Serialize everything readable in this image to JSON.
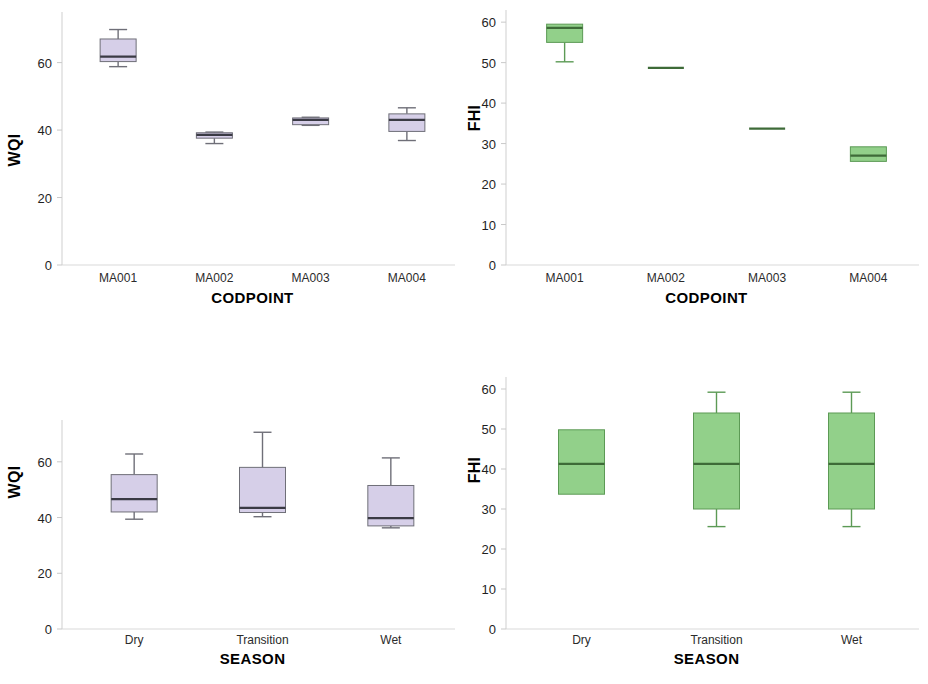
{
  "figure": {
    "width": 928,
    "height": 684,
    "background": "#ffffff",
    "panel_count": 4
  },
  "colors": {
    "wqi_box_fill": "#d6cfe8",
    "wqi_box_stroke": "#6f6f78",
    "fhi_box_fill": "#92d08a",
    "fhi_box_stroke": "#5c9a55",
    "median_wqi": "#3a3a44",
    "median_fhi": "#3e6b38",
    "axis": "#d9d9d9",
    "text": "#1f1f1f"
  },
  "chart_data": [
    {
      "id": "wqi-by-codpoint",
      "type": "box",
      "panel": "top-left",
      "title": "",
      "xlabel": "CODPOINT",
      "ylabel": "WQI",
      "ylim": [
        0,
        75
      ],
      "yticks": [
        0,
        20,
        40,
        60
      ],
      "ytick_labels": [
        "0",
        "20",
        "40",
        "60"
      ],
      "grid": false,
      "categories": [
        "MA001",
        "MA002",
        "MA003",
        "MA004"
      ],
      "box_fill": "#d6cfe8",
      "boxes": [
        {
          "category": "MA001",
          "whisker_low": 58.8,
          "q1": 60.3,
          "median": 61.8,
          "q3": 67.0,
          "whisker_high": 69.8
        },
        {
          "category": "MA002",
          "whisker_low": 36.0,
          "q1": 37.6,
          "median": 38.6,
          "q3": 39.2,
          "whisker_high": 39.4
        },
        {
          "category": "MA003",
          "whisker_low": 41.4,
          "q1": 41.6,
          "median": 43.0,
          "q3": 43.6,
          "whisker_high": 43.8
        },
        {
          "category": "MA004",
          "whisker_low": 36.9,
          "q1": 39.6,
          "median": 43.0,
          "q3": 44.8,
          "whisker_high": 46.6
        }
      ]
    },
    {
      "id": "fhi-by-codpoint",
      "type": "box",
      "panel": "top-right",
      "title": "",
      "xlabel": "CODPOINT",
      "ylabel": "FHI",
      "ylim": [
        0,
        63
      ],
      "yticks": [
        0,
        10,
        20,
        30,
        40,
        50,
        60
      ],
      "ytick_labels": [
        "0",
        "10",
        "20",
        "30",
        "40",
        "50",
        "60"
      ],
      "grid": false,
      "categories": [
        "MA001",
        "MA002",
        "MA003",
        "MA004"
      ],
      "box_fill": "#92d08a",
      "boxes": [
        {
          "category": "MA001",
          "whisker_low": 50.2,
          "q1": 55.0,
          "median": 58.6,
          "q3": 59.5,
          "whisker_high": 59.5
        },
        {
          "category": "MA002",
          "whisker_low": 48.7,
          "q1": 48.7,
          "median": 48.7,
          "q3": 48.7,
          "whisker_high": 48.7
        },
        {
          "category": "MA003",
          "whisker_low": 33.7,
          "q1": 33.7,
          "median": 33.7,
          "q3": 33.7,
          "whisker_high": 33.7
        },
        {
          "category": "MA004",
          "whisker_low": 25.6,
          "q1": 25.6,
          "median": 27.0,
          "q3": 29.2,
          "whisker_high": 29.2
        }
      ]
    },
    {
      "id": "wqi-by-season",
      "type": "box",
      "panel": "bottom-left",
      "title": "",
      "xlabel": "SEASON",
      "ylabel": "WQI",
      "ylim": [
        0,
        75
      ],
      "yticks": [
        0,
        20,
        40,
        60
      ],
      "ytick_labels": [
        "0",
        "20",
        "40",
        "60"
      ],
      "grid": false,
      "categories": [
        "Dry",
        "Transition",
        "Wet"
      ],
      "box_fill": "#d6cfe8",
      "boxes": [
        {
          "category": "Dry",
          "whisker_low": 39.4,
          "q1": 42.0,
          "median": 46.6,
          "q3": 55.4,
          "whisker_high": 62.8
        },
        {
          "category": "Transition",
          "whisker_low": 40.3,
          "q1": 41.8,
          "median": 43.5,
          "q3": 58.0,
          "whisker_high": 70.6
        },
        {
          "category": "Wet",
          "whisker_low": 36.3,
          "q1": 37.0,
          "median": 39.8,
          "q3": 51.5,
          "whisker_high": 61.4
        }
      ]
    },
    {
      "id": "fhi-by-season",
      "type": "box",
      "panel": "bottom-right",
      "title": "",
      "xlabel": "SEASON",
      "ylabel": "FHI",
      "ylim": [
        0,
        63
      ],
      "yticks": [
        0,
        10,
        20,
        30,
        40,
        50,
        60
      ],
      "ytick_labels": [
        "0",
        "10",
        "20",
        "30",
        "40",
        "50",
        "60"
      ],
      "grid": false,
      "categories": [
        "Dry",
        "Transition",
        "Wet"
      ],
      "box_fill": "#92d08a",
      "boxes": [
        {
          "category": "Dry",
          "whisker_low": 33.7,
          "q1": 33.7,
          "median": 41.3,
          "q3": 49.8,
          "whisker_high": 49.8
        },
        {
          "category": "Transition",
          "whisker_low": 25.6,
          "q1": 30.0,
          "median": 41.3,
          "q3": 54.0,
          "whisker_high": 59.2
        },
        {
          "category": "Wet",
          "whisker_low": 25.6,
          "q1": 30.0,
          "median": 41.3,
          "q3": 54.0,
          "whisker_high": 59.2
        }
      ]
    }
  ]
}
